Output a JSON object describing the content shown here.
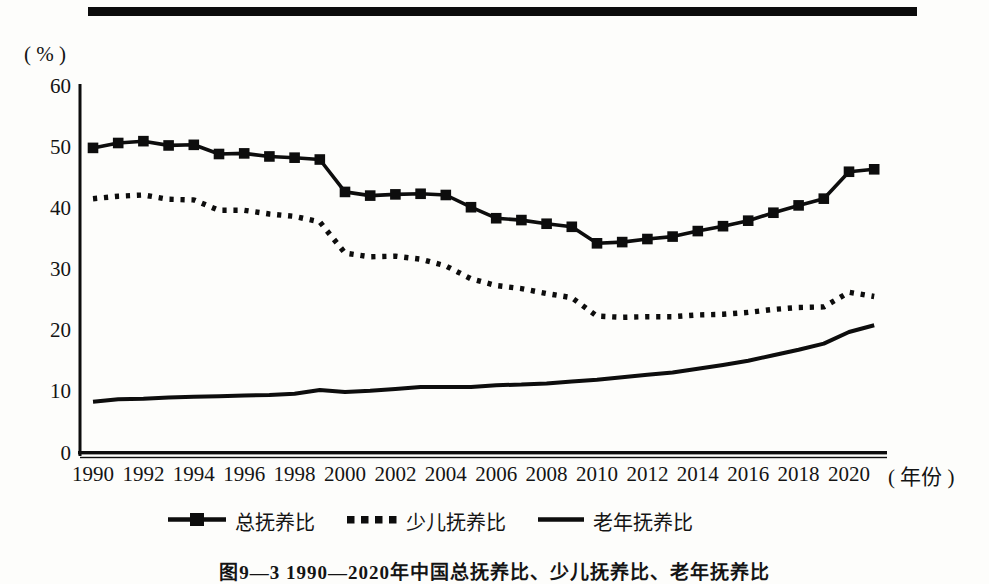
{
  "page": {
    "background": "#fdfdfb",
    "ink": "#141414",
    "line_color": "#0d0d0d"
  },
  "decor": {
    "top_rule": true
  },
  "chart_data": {
    "type": "line",
    "title": "图9—3 1990—2020年中国总抚养比、少儿抚养比、老年抚养比",
    "ylabel": "( % )",
    "xlabel": "( 年份 )",
    "ylim": [
      0,
      60
    ],
    "yticks": [
      0,
      10,
      20,
      30,
      40,
      50,
      60
    ],
    "xticks": [
      1990,
      1992,
      1994,
      1996,
      1998,
      2000,
      2002,
      2004,
      2006,
      2008,
      2010,
      2012,
      2014,
      2016,
      2018,
      2020
    ],
    "grid": false,
    "legend_position": "bottom",
    "x": [
      1990,
      1991,
      1992,
      1993,
      1994,
      1995,
      1996,
      1997,
      1998,
      1999,
      2000,
      2001,
      2002,
      2003,
      2004,
      2005,
      2006,
      2007,
      2008,
      2009,
      2010,
      2011,
      2012,
      2013,
      2014,
      2015,
      2016,
      2017,
      2018,
      2019,
      2020,
      2021
    ],
    "series": [
      {
        "name": "总抚养比",
        "style": "line-square-markers",
        "values": [
          49.8,
          50.6,
          50.9,
          50.2,
          50.3,
          48.8,
          48.9,
          48.4,
          48.2,
          47.9,
          42.6,
          42.0,
          42.2,
          42.3,
          42.1,
          40.1,
          38.3,
          38.0,
          37.4,
          36.9,
          34.2,
          34.4,
          34.9,
          35.3,
          36.2,
          37.0,
          37.9,
          39.2,
          40.4,
          41.5,
          45.9,
          46.3
        ]
      },
      {
        "name": "少儿抚养比",
        "style": "dotted",
        "values": [
          41.5,
          41.9,
          42.1,
          41.4,
          41.3,
          39.6,
          39.6,
          39.0,
          38.6,
          37.7,
          32.6,
          32.0,
          32.1,
          31.6,
          30.5,
          28.4,
          27.3,
          26.8,
          26.0,
          25.3,
          22.3,
          22.1,
          22.2,
          22.2,
          22.5,
          22.6,
          22.9,
          23.4,
          23.7,
          23.8,
          26.2,
          25.5
        ]
      },
      {
        "name": "老年抚养比",
        "style": "solid",
        "values": [
          8.3,
          8.7,
          8.8,
          9.0,
          9.1,
          9.2,
          9.3,
          9.4,
          9.6,
          10.2,
          9.9,
          10.1,
          10.4,
          10.7,
          10.7,
          10.7,
          11.0,
          11.1,
          11.3,
          11.6,
          11.9,
          12.3,
          12.7,
          13.1,
          13.7,
          14.3,
          15.0,
          15.9,
          16.8,
          17.8,
          19.7,
          20.8
        ]
      }
    ]
  },
  "legend": {
    "items": [
      {
        "label": "总抚养比",
        "marker": "line-with-square-marker"
      },
      {
        "label": "少儿抚养比",
        "marker": "dotted-line"
      },
      {
        "label": "老年抚养比",
        "marker": "solid-line"
      }
    ]
  }
}
